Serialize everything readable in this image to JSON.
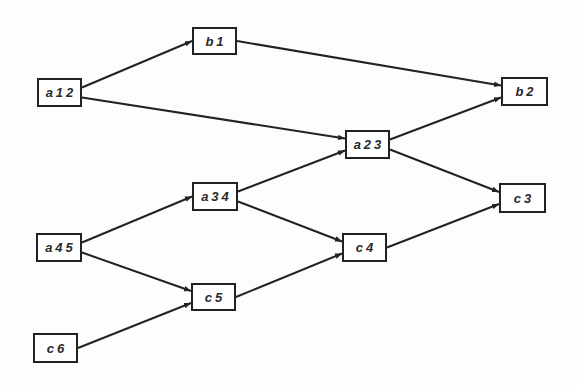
{
  "diagram": {
    "type": "directed-graph",
    "colors": {
      "stroke": "#222222",
      "node_fill": "#ffffff",
      "text": "#2a2a2a",
      "background": "#fdfdfd"
    },
    "nodes": [
      {
        "id": "a12",
        "label": "a12",
        "x": 37,
        "y": 78,
        "w": 45,
        "h": 29
      },
      {
        "id": "b1",
        "label": "b1",
        "x": 192,
        "y": 27,
        "w": 45,
        "h": 28
      },
      {
        "id": "b2",
        "label": "b2",
        "x": 501,
        "y": 77,
        "w": 47,
        "h": 29
      },
      {
        "id": "a23",
        "label": "a23",
        "x": 345,
        "y": 130,
        "w": 45,
        "h": 29
      },
      {
        "id": "a34",
        "label": "a34",
        "x": 192,
        "y": 182,
        "w": 46,
        "h": 29
      },
      {
        "id": "c3",
        "label": "c3",
        "x": 499,
        "y": 183,
        "w": 47,
        "h": 30
      },
      {
        "id": "a45",
        "label": "a45",
        "x": 36,
        "y": 233,
        "w": 46,
        "h": 29
      },
      {
        "id": "c4",
        "label": "c4",
        "x": 342,
        "y": 233,
        "w": 45,
        "h": 29
      },
      {
        "id": "c5",
        "label": "c5",
        "x": 191,
        "y": 283,
        "w": 45,
        "h": 28
      },
      {
        "id": "c6",
        "label": "c6",
        "x": 33,
        "y": 333,
        "w": 45,
        "h": 30
      }
    ],
    "edges": [
      {
        "from": "a12",
        "to": "b1"
      },
      {
        "from": "a12",
        "to": "a23"
      },
      {
        "from": "b1",
        "to": "b2"
      },
      {
        "from": "a23",
        "to": "b2"
      },
      {
        "from": "a23",
        "to": "c3"
      },
      {
        "from": "a34",
        "to": "a23"
      },
      {
        "from": "a34",
        "to": "c4"
      },
      {
        "from": "a45",
        "to": "a34"
      },
      {
        "from": "a45",
        "to": "c5"
      },
      {
        "from": "c5",
        "to": "c4"
      },
      {
        "from": "c4",
        "to": "c3"
      },
      {
        "from": "c6",
        "to": "c5"
      }
    ]
  }
}
